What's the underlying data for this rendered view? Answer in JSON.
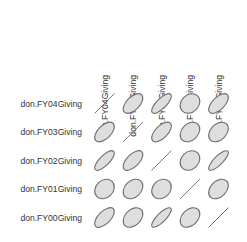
{
  "chart_data": {
    "type": "heatmap",
    "subtype": "correlation-ellipse-matrix",
    "title": "",
    "variables": [
      "don.FY04Giving",
      "don.FY03Giving",
      "don.FY02Giving",
      "don.FY01Giving",
      "don.FY00Giving"
    ],
    "row_labels": [
      "don.FY04Giving",
      "don.FY03Giving",
      "don.FY02Giving",
      "don.FY01Giving",
      "don.FY00Giving"
    ],
    "col_labels": [
      "don.FY04Giving",
      "don.FY03Giving",
      "don.FY02Giving",
      "don.FY01Giving",
      "don.FY00Giving"
    ],
    "correlations": [
      [
        1.0,
        0.55,
        0.75,
        0.2,
        0.6
      ],
      [
        0.55,
        1.0,
        0.6,
        0.3,
        0.35
      ],
      [
        0.75,
        0.6,
        1.0,
        0.2,
        0.8
      ],
      [
        0.2,
        0.3,
        0.2,
        1.0,
        0.35
      ],
      [
        0.6,
        0.35,
        0.8,
        0.35,
        1.0
      ]
    ],
    "diagonal_style": "line",
    "grid": false,
    "legend": "none"
  },
  "style": {
    "ellipse_fill": "#dedede",
    "ellipse_stroke": "#6e6e6e",
    "text_color": "#333333"
  }
}
